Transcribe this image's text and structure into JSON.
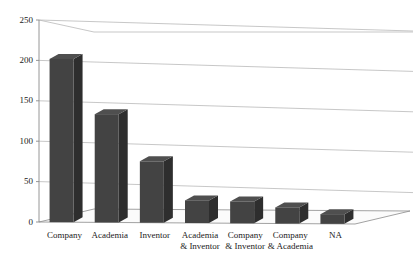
{
  "chart_data": {
    "type": "bar",
    "title": "",
    "xlabel": "",
    "ylabel": "Number of patents",
    "categories": [
      "Company",
      "Academia",
      "Inventor",
      "Academia\n& Inventor",
      "Company\n& Inventor",
      "Company\n& Academia",
      "NA"
    ],
    "category_lines": [
      [
        "Company"
      ],
      [
        "Academia"
      ],
      [
        "Inventor"
      ],
      [
        "Academia",
        "& Inventor"
      ],
      [
        "Company",
        "& Inventor"
      ],
      [
        "Company",
        "& Academia"
      ],
      [
        "NA"
      ]
    ],
    "values": [
      202,
      134,
      76,
      28,
      27,
      20,
      12
    ],
    "ylim": [
      0,
      250
    ],
    "yticks": [
      0,
      50,
      100,
      150,
      200,
      250
    ],
    "ytick_labels": [
      "0",
      "50",
      "100",
      "150",
      "200",
      "250"
    ],
    "grid": true,
    "legend": "none",
    "projection": "3d-perspective",
    "colors": {
      "bar_front": "#434343",
      "bar_top": "#4f4f4f",
      "bar_side": "#2e2e2e",
      "axis": "#8a8a8a",
      "grid": "#b9b9b9",
      "floor": "#fbfbfb",
      "background": "#ffffff",
      "text": "#1a1a1a"
    }
  }
}
